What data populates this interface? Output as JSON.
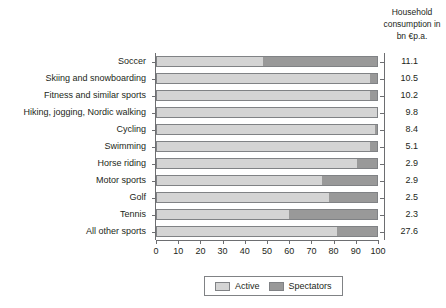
{
  "value_column": {
    "header_line1": "Household",
    "header_line2": "consumption in",
    "header_line3": "bn €p.a."
  },
  "legend": {
    "active_label": "Active",
    "spectators_label": "Spectators"
  },
  "colors": {
    "active": "#d4d4d4",
    "spectators": "#999999",
    "axis": "#6d6e71",
    "border": "#808285",
    "text": "#231f20",
    "background": "#ffffff"
  },
  "chart_data": {
    "type": "bar",
    "orientation": "horizontal",
    "stacked": true,
    "stack_mode": "percent",
    "title": "",
    "subtitle": "",
    "xlabel": "",
    "ylabel": "",
    "xlim": [
      0,
      100
    ],
    "xticks": [
      0,
      10,
      20,
      30,
      40,
      50,
      60,
      70,
      80,
      90,
      100
    ],
    "xtick_labels": [
      "0",
      "10",
      "20",
      "30",
      "40",
      "50",
      "60",
      "70",
      "80",
      "90",
      "100"
    ],
    "grid": false,
    "legend_position": "bottom",
    "categories": [
      "Soccer",
      "Skiing and snowboarding",
      "Fitness and similar sports",
      "Hiking, jogging, Nordic walking",
      "Cycling",
      "Swimming",
      "Horse riding",
      "Motor sports",
      "Golf",
      "Tennis",
      "All other sports"
    ],
    "series": [
      {
        "name": "Active",
        "color": "#d4d4d4",
        "values": [
          48,
          97,
          97,
          100,
          99,
          97,
          91,
          75,
          78,
          60,
          82
        ]
      },
      {
        "name": "Spectators",
        "color": "#999999",
        "values": [
          52,
          3,
          3,
          0,
          1,
          3,
          9,
          25,
          22,
          40,
          18
        ]
      }
    ],
    "annotations": {
      "value_column_label": "Household consumption in bn €p.a.",
      "values": [
        "11.1",
        "10.5",
        "10.2",
        "9.8",
        "8.4",
        "5.1",
        "2.9",
        "2.9",
        "2.5",
        "2.3",
        "27.6"
      ]
    }
  }
}
